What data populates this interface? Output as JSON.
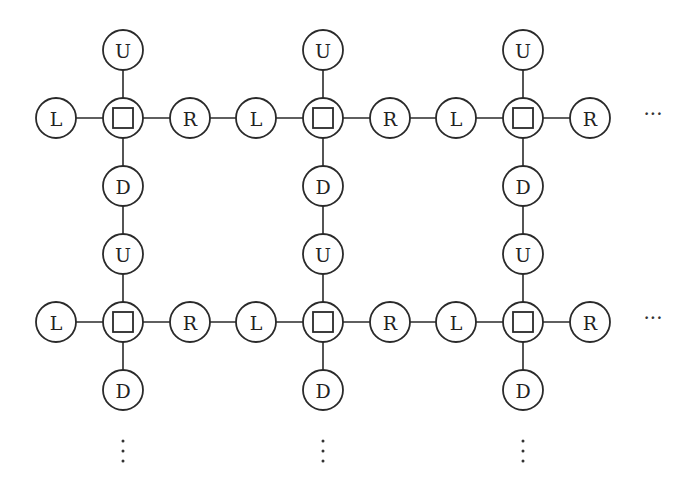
{
  "diagram": {
    "type": "grid-graph",
    "node_radius": 20,
    "labels": {
      "up": "U",
      "down": "D",
      "left": "L",
      "right": "R",
      "center": "□"
    },
    "columns_x": [
      123,
      323,
      523
    ],
    "rows_y": [
      118,
      322
    ],
    "offset_horizontal": 67,
    "offset_vertical": 68,
    "continuation": {
      "horizontal": "···",
      "vertical": "⋮"
    },
    "stroke_color": "#2a2a2a",
    "background": "#ffffff"
  }
}
